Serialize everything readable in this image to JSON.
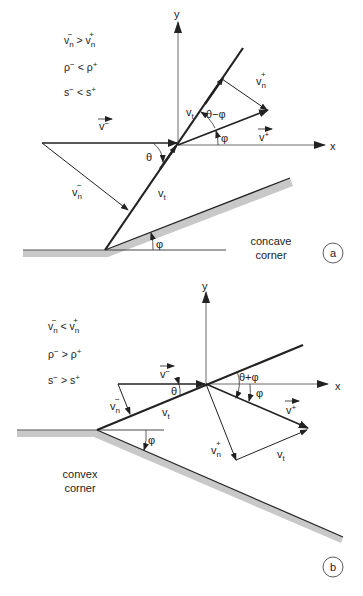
{
  "figure": {
    "panels": [
      {
        "id": "a",
        "badge": "a",
        "caption_line1": "concave",
        "caption_line2": "corner",
        "relations": [
          {
            "lhs": "v",
            "lhs_sub": "n",
            "lhs_sup": "−",
            "op": ">",
            "rhs": "v",
            "rhs_sub": "n",
            "rhs_sup": "+"
          },
          {
            "lhs": "ρ",
            "lhs_sup": "−",
            "op": "<",
            "rhs": "ρ",
            "rhs_sup": "+"
          },
          {
            "lhs": "s",
            "lhs_sup": "−",
            "op": "<",
            "rhs": "s",
            "rhs_sup": "+"
          }
        ],
        "axis_x": "x",
        "axis_y": "y",
        "labels": {
          "v_minus": "v",
          "v_minus_sup": "−",
          "v_plus": "v",
          "v_plus_sup": "+",
          "vn_minus": "v",
          "vn_minus_sub": "n",
          "vn_minus_sup": "−",
          "vn_plus": "v",
          "vn_plus_sub": "n",
          "vn_plus_sup": "+",
          "vt_upper": "v",
          "vt_upper_sub": "t",
          "vt_lower": "v",
          "vt_lower_sub": "t",
          "theta": "θ",
          "theta_minus_phi": "θ−φ",
          "phi_flow": "φ",
          "phi_wall": "φ"
        }
      },
      {
        "id": "b",
        "badge": "b",
        "caption_line1": "convex",
        "caption_line2": "corner",
        "relations": [
          {
            "lhs": "v",
            "lhs_sub": "n",
            "lhs_sup": "−",
            "op": "<",
            "rhs": "v",
            "rhs_sub": "n",
            "rhs_sup": "+"
          },
          {
            "lhs": "ρ",
            "lhs_sup": "−",
            "op": ">",
            "rhs": "ρ",
            "rhs_sup": "+"
          },
          {
            "lhs": "s",
            "lhs_sup": "−",
            "op": ">",
            "rhs": "s",
            "rhs_sup": "+"
          }
        ],
        "axis_x": "x",
        "axis_y": "y",
        "labels": {
          "v_minus": "v",
          "v_minus_sup": "−",
          "v_plus": "v",
          "v_plus_sup": "+",
          "vn_minus": "v",
          "vn_minus_sub": "n",
          "vn_minus_sup": "−",
          "vn_plus": "v",
          "vn_plus_sub": "n",
          "vn_plus_sup": "+",
          "vt_upper": "v",
          "vt_upper_sub": "t",
          "vt_lower": "v",
          "vt_lower_sub": "t",
          "theta": "θ",
          "theta_plus_phi": "θ+φ",
          "phi_flow": "φ",
          "phi_wall": "φ"
        }
      }
    ],
    "colors": {
      "line": "#222222",
      "thin_line": "#444444",
      "wall_fill": "#c8c8c8",
      "background": "#ffffff"
    }
  }
}
